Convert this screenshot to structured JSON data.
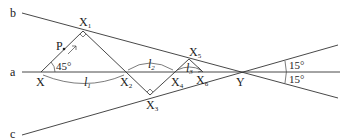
{
  "diagram": {
    "lines": [
      {
        "name": "a",
        "label": "a"
      },
      {
        "name": "b",
        "label": "b"
      },
      {
        "name": "c",
        "label": "c"
      }
    ],
    "points": {
      "X": {
        "label": "X"
      },
      "P": {
        "label": "P"
      },
      "Y": {
        "label": "Y"
      },
      "X1": {
        "label": "X",
        "sub": "1"
      },
      "X2": {
        "label": "X",
        "sub": "2"
      },
      "X3": {
        "label": "X",
        "sub": "3"
      },
      "X4": {
        "label": "X",
        "sub": "4"
      },
      "X5": {
        "label": "X",
        "sub": "5"
      },
      "X6": {
        "label": "X",
        "sub": "6"
      }
    },
    "segments": {
      "l1": {
        "label": "l",
        "sub": "1"
      },
      "l2": {
        "label": "l",
        "sub": "2"
      },
      "l3": {
        "label": "l",
        "sub": "3"
      }
    },
    "angles": {
      "start_angle": "45°",
      "upper_angle": "15°",
      "lower_angle": "15°"
    }
  }
}
